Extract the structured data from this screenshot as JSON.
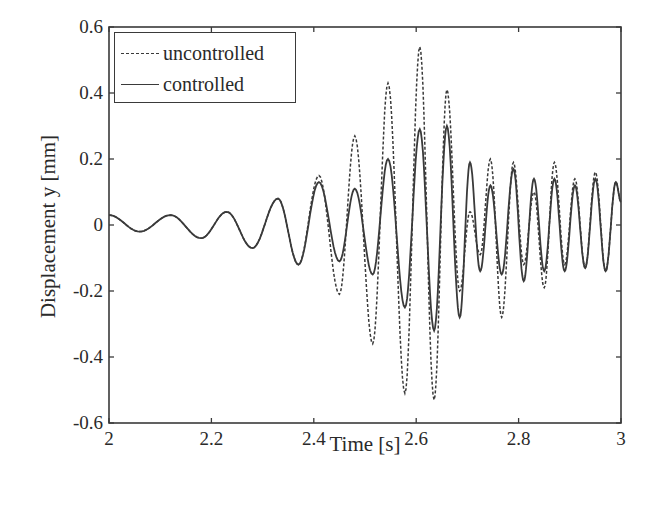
{
  "chart_data": {
    "type": "line",
    "title": "",
    "xlabel": "Time [s]",
    "ylabel": "Displacement y [mm]",
    "xlim": [
      2,
      3
    ],
    "ylim": [
      -0.6,
      0.6
    ],
    "xticks": [
      2,
      2.2,
      2.4,
      2.6,
      2.8,
      3
    ],
    "xtick_labels": [
      "2",
      "2.2",
      "2.4",
      "2.6",
      "2.8",
      "3"
    ],
    "yticks": [
      0.6,
      0.4,
      0.2,
      0,
      -0.2,
      -0.4,
      -0.6
    ],
    "ytick_labels": [
      "0.6",
      "0.4",
      "0.2",
      "0",
      "-0.2",
      "-0.4",
      "-0.6"
    ],
    "grid": false,
    "legend_position": "upper left",
    "series": [
      {
        "name": "uncontrolled",
        "style": "dashed",
        "x": [
          2.0,
          2.06,
          2.12,
          2.18,
          2.23,
          2.28,
          2.33,
          2.37,
          2.41,
          2.45,
          2.48,
          2.515,
          2.545,
          2.578,
          2.607,
          2.635,
          2.66,
          2.685,
          2.705,
          2.725,
          2.745,
          2.767,
          2.79,
          2.81,
          2.83,
          2.85,
          2.87,
          2.89,
          2.91,
          2.93,
          2.95,
          2.97,
          2.99,
          3.0
        ],
        "values": [
          0.03,
          -0.02,
          0.03,
          -0.04,
          0.04,
          -0.07,
          0.08,
          -0.12,
          0.15,
          -0.21,
          0.27,
          -0.36,
          0.43,
          -0.51,
          0.54,
          -0.53,
          0.41,
          -0.2,
          0.04,
          -0.09,
          0.2,
          -0.28,
          0.19,
          -0.12,
          0.1,
          -0.19,
          0.19,
          -0.12,
          0.14,
          -0.13,
          0.16,
          -0.14,
          0.13,
          0.07
        ]
      },
      {
        "name": "controlled",
        "style": "solid",
        "x": [
          2.0,
          2.06,
          2.12,
          2.18,
          2.23,
          2.28,
          2.33,
          2.37,
          2.41,
          2.45,
          2.48,
          2.515,
          2.545,
          2.578,
          2.607,
          2.635,
          2.66,
          2.685,
          2.705,
          2.725,
          2.745,
          2.767,
          2.79,
          2.81,
          2.83,
          2.85,
          2.87,
          2.89,
          2.91,
          2.93,
          2.95,
          2.97,
          2.99,
          3.0
        ],
        "values": [
          0.03,
          -0.02,
          0.03,
          -0.04,
          0.04,
          -0.07,
          0.08,
          -0.12,
          0.13,
          -0.11,
          0.11,
          -0.15,
          0.2,
          -0.25,
          0.29,
          -0.32,
          0.3,
          -0.28,
          0.19,
          -0.14,
          0.12,
          -0.15,
          0.17,
          -0.17,
          0.14,
          -0.14,
          0.14,
          -0.14,
          0.12,
          -0.13,
          0.14,
          -0.14,
          0.13,
          0.07
        ]
      }
    ]
  },
  "legend": {
    "items": [
      {
        "label": "uncontrolled",
        "style": "dashed"
      },
      {
        "label": "controlled",
        "style": "solid"
      }
    ]
  },
  "colors": {
    "line": "#3a3a3a",
    "axis": "#3a3a3a",
    "background": "#ffffff"
  }
}
